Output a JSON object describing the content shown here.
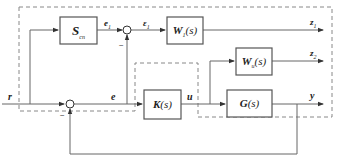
{
  "diagram": {
    "type": "block-diagram",
    "blocks": [
      {
        "id": "Scn",
        "symbol": "S",
        "sub": "cn",
        "arg": ""
      },
      {
        "id": "W1",
        "symbol": "W",
        "sub": "1",
        "arg": "(s)"
      },
      {
        "id": "Wu",
        "symbol": "W",
        "sub": "u",
        "arg": "(s)"
      },
      {
        "id": "K",
        "symbol": "K",
        "sub": "",
        "arg": "(s)"
      },
      {
        "id": "G",
        "symbol": "G",
        "sub": "",
        "arg": "(s)"
      }
    ],
    "signals": {
      "r": "r",
      "e": "e",
      "e1": {
        "symbol": "e",
        "sub": "1"
      },
      "eps1": {
        "symbol": "ε",
        "sub": "1"
      },
      "u": "u",
      "y": "y",
      "z1": {
        "symbol": "z",
        "sub": "1"
      },
      "z2": {
        "symbol": "z",
        "sub": "2"
      }
    },
    "minus_sign": "−",
    "colors": {
      "line": "#666666",
      "block_border": "#555555",
      "dashed": "#888888",
      "text": "#222222"
    }
  }
}
